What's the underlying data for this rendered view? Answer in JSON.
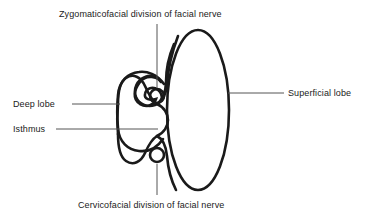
{
  "figure": {
    "stroke_color": "#1a1a1a",
    "leader_color": "#555555",
    "background_color": "#ffffff"
  },
  "labels": {
    "zygomaticofacial": "Zygomaticofacial division of facial nerve",
    "cervicofacial": "Cervicofacial division of facial nerve",
    "deep_lobe": "Deep lobe",
    "isthmus": "Isthmus",
    "superficial_lobe": "Superficial lobe"
  },
  "shapes": {
    "superficial_lobe": {
      "name": "superficial-lobe-outline",
      "type": "oval",
      "cx": 198,
      "cy": 110,
      "rx": 32,
      "ry": 80
    },
    "deep_lobe": {
      "name": "deep-lobe-outline",
      "type": "lobe",
      "left_x": 118,
      "top_y": 78,
      "bottom_y": 162
    },
    "zygomaticofacial_nerve": {
      "name": "zygomaticofacial-nerve-circle",
      "cx": 157,
      "cy": 96,
      "r": 7
    },
    "cervicofacial_nerve": {
      "name": "cervicofacial-nerve-circle",
      "cx": 157,
      "cy": 155,
      "r": 7
    }
  },
  "leader_lines": {
    "zygomaticofacial": {
      "x1": 157,
      "y1": 24,
      "x2": 157,
      "y2": 88
    },
    "cervicofacial": {
      "x1": 157,
      "y1": 164,
      "x2": 157,
      "y2": 193
    },
    "deep_lobe": {
      "x1": 72,
      "y1": 104,
      "x2": 121,
      "y2": 104
    },
    "isthmus": {
      "x1": 56,
      "y1": 129,
      "x2": 158,
      "y2": 129
    },
    "superficial_lobe": {
      "x1": 228,
      "y1": 93,
      "x2": 284,
      "y2": 93
    }
  }
}
